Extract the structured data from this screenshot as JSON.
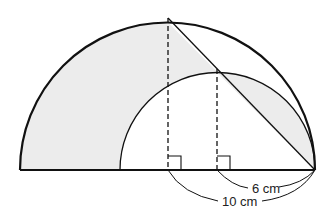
{
  "diagram": {
    "colors": {
      "stroke": "#111111",
      "shade": "#ececec",
      "background": "#ffffff"
    },
    "labels": {
      "inner": "6 cm",
      "outer": "10 cm"
    },
    "elements": {
      "large_semicircle": {
        "radius_cm": 10
      },
      "small_semicircle": {
        "radius_cm": 6
      },
      "right_angle_marks": 2,
      "dashed_perpendiculars": 2
    }
  }
}
